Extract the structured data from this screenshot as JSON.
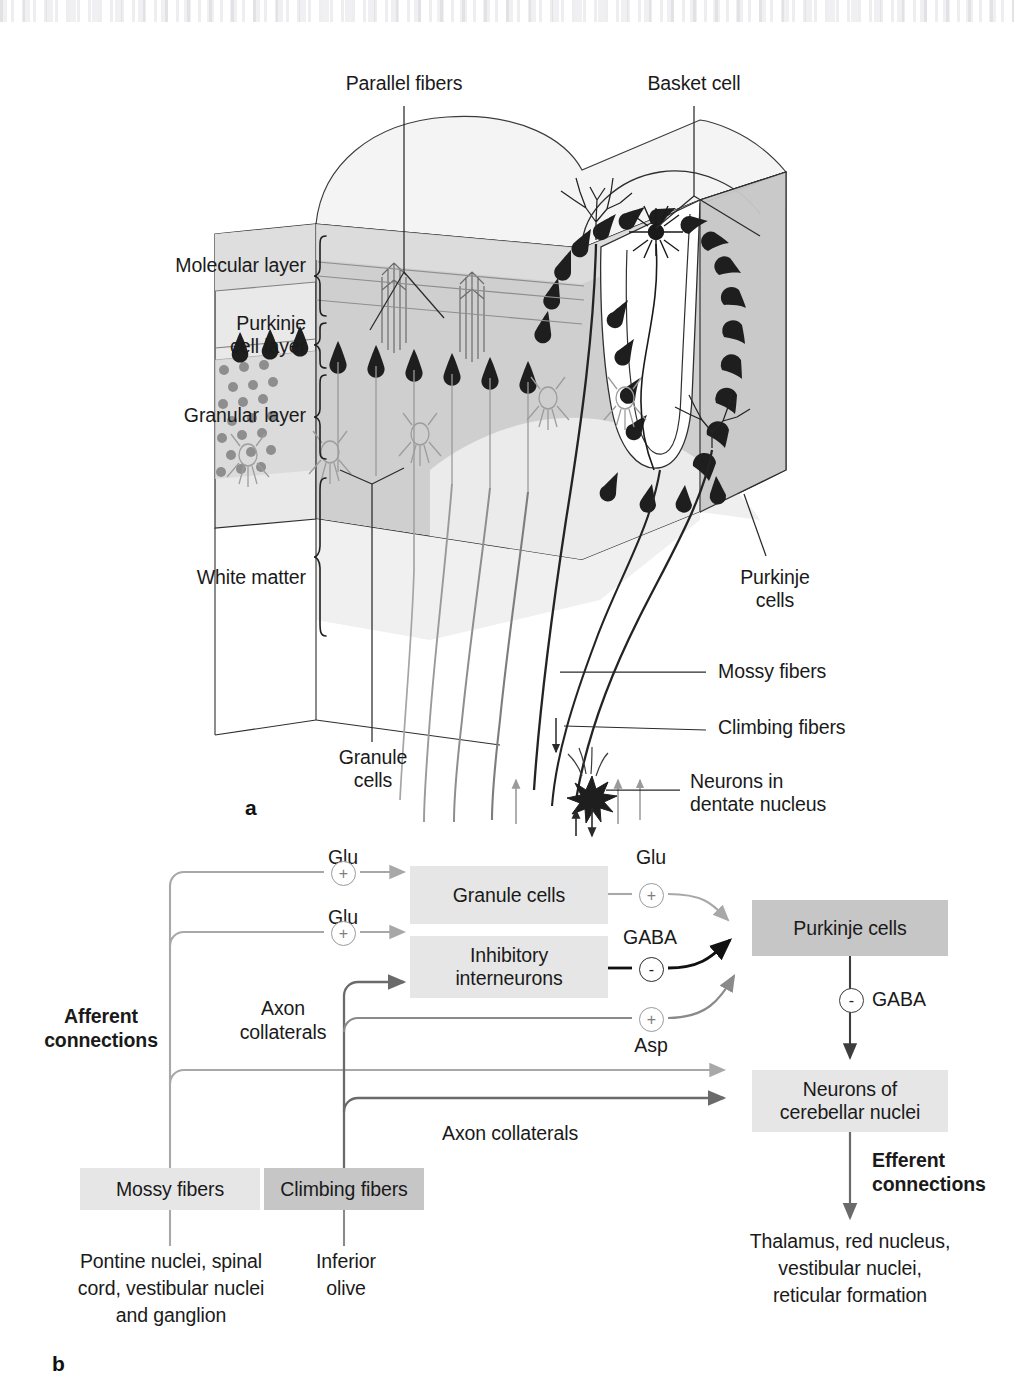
{
  "figure": {
    "panel_a_letter": "a",
    "panel_b_letter": "b"
  },
  "panel_a": {
    "title_labels": {
      "parallel_fibers": "Parallel fibers",
      "basket_cell": "Basket cell"
    },
    "layer_labels": [
      {
        "id": "molecular-layer",
        "text": "Molecular layer"
      },
      {
        "id": "purkinje-cell-layer",
        "text": "Purkinje\ncell layer"
      },
      {
        "id": "granular-layer",
        "text": "Granular layer"
      },
      {
        "id": "white-matter",
        "text": "White matter"
      }
    ],
    "callouts": [
      {
        "id": "granule-cells",
        "text": "Granule\ncells"
      },
      {
        "id": "purkinje-cells",
        "text": "Purkinje\ncells"
      },
      {
        "id": "mossy-fibers",
        "text": "Mossy fibers"
      },
      {
        "id": "climbing-fibers",
        "text": "Climbing fibers"
      },
      {
        "id": "dentate-neurons",
        "text": "Neurons in\ndentate nucleus"
      }
    ]
  },
  "panel_b": {
    "boxes": [
      {
        "id": "granule-cells",
        "label": "Granule cells",
        "shade": "light"
      },
      {
        "id": "inhibitory-interneurons",
        "label": "Inhibitory\ninterneurons",
        "shade": "light"
      },
      {
        "id": "purkinje-cells",
        "label": "Purkinje cells",
        "shade": "dark"
      },
      {
        "id": "cerebellar-nuclei",
        "label": "Neurons of\ncerebellar nuclei",
        "shade": "light"
      },
      {
        "id": "mossy-fibers",
        "label": "Mossy fibers",
        "shade": "light"
      },
      {
        "id": "climbing-fibers",
        "label": "Climbing fibers",
        "shade": "dark"
      }
    ],
    "transmitters": [
      {
        "id": "glu-mossy-to-granule",
        "text": "Glu",
        "sign": "+"
      },
      {
        "id": "glu-mossy-to-inhib",
        "text": "Glu",
        "sign": "+"
      },
      {
        "id": "glu-granule-to-purkinje",
        "text": "Glu",
        "sign": "+"
      },
      {
        "id": "gaba-inhib-to-purkinje",
        "text": "GABA",
        "sign": "-"
      },
      {
        "id": "asp-climbing-to-purkinje",
        "text": "Asp",
        "sign": "+"
      },
      {
        "id": "gaba-purkinje-to-nuclei",
        "text": "GABA",
        "sign": "-"
      }
    ],
    "annotations": {
      "afferent_connections": "Afferent\nconnections",
      "efferent_connections": "Efferent\nconnections",
      "axon_collaterals_climbing": "Axon\ncollaterals",
      "axon_collaterals_mossy": "Axon collaterals"
    },
    "sources": [
      {
        "id": "mossy-fiber-origin",
        "text": "Pontine nuclei, spinal\ncord, vestibular nuclei\nand ganglion"
      },
      {
        "id": "climbing-fiber-origin",
        "text": "Inferior\nolive"
      }
    ],
    "targets": [
      {
        "id": "efferent-targets",
        "text": "Thalamus, red nucleus,\nvestibular nuclei,\nreticular formation"
      }
    ]
  },
  "colors": {
    "box_light": "#e6e6e6",
    "box_dark": "#c6c6c6",
    "gray_arrow": "#9a9a9a",
    "mid_arrow": "#7d7d7d",
    "dark_arrow": "#3d3d3d",
    "black_arrow": "#111111",
    "text": "#1a1a1a",
    "cortex_fill": "#c9c9c9",
    "molecular_fill": "#dcdcdc",
    "top_fill": "#f2f2f2",
    "white_matter_fill": "#ebebeb",
    "neuron_dark": "#1e1e1e",
    "granule_dot": "#8e8e8e"
  }
}
